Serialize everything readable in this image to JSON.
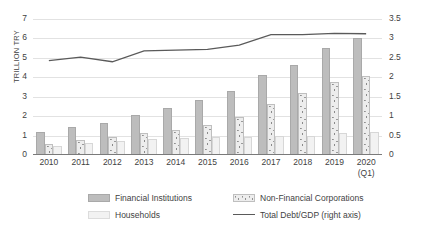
{
  "chart_data": {
    "type": "bar",
    "title": "",
    "subtitle": "",
    "xlabel": "",
    "ylabel": "TRILLION TRY",
    "ylabel_right": "",
    "categories": [
      "2010",
      "2011",
      "2012",
      "2013",
      "2014",
      "2015",
      "2016",
      "2017",
      "2018",
      "2019",
      "2020"
    ],
    "category_sublabels": [
      "",
      "",
      "",
      "",
      "",
      "",
      "",
      "",
      "",
      "",
      "(Q1)"
    ],
    "ylim": [
      0,
      7
    ],
    "yticks": [
      "0",
      "1",
      "2",
      "3",
      "4",
      "5",
      "6",
      "7"
    ],
    "ylim_right": [
      0,
      3.5
    ],
    "yticks_right": [
      "0",
      "0.5",
      "1",
      "1.5",
      "2",
      "2.5",
      "3",
      "3.5"
    ],
    "grid": true,
    "legend_position": "bottom",
    "series": [
      {
        "name": "Financial Institutions",
        "axis": "left",
        "type": "bar",
        "color": "#bdbdbd",
        "values": [
          1.2,
          1.45,
          1.65,
          2.05,
          2.4,
          2.85,
          3.3,
          4.1,
          4.65,
          5.5,
          6.0
        ]
      },
      {
        "name": "Non-Financial Corporations",
        "axis": "left",
        "type": "bar",
        "color": "#ededed",
        "values": [
          0.55,
          0.75,
          0.95,
          1.15,
          1.3,
          1.55,
          1.95,
          2.65,
          3.2,
          3.75,
          4.05
        ]
      },
      {
        "name": "Households",
        "axis": "left",
        "type": "bar",
        "color": "#f2f2f2",
        "values": [
          0.45,
          0.62,
          0.72,
          0.82,
          0.88,
          0.92,
          0.95,
          1.0,
          1.0,
          1.15,
          1.2
        ]
      },
      {
        "name": "Total Debt/GDP (right axis)",
        "axis": "right",
        "type": "line",
        "color": "#5a5a5a",
        "values": [
          2.43,
          2.52,
          2.4,
          2.68,
          2.7,
          2.72,
          2.83,
          3.1,
          3.1,
          3.13,
          3.12
        ]
      }
    ]
  },
  "legend": {
    "items": [
      {
        "label": "Financial Institutions",
        "swatch": "fi"
      },
      {
        "label": "Non-Financial Corporations",
        "swatch": "nfc"
      },
      {
        "label": "Households",
        "swatch": "hh"
      },
      {
        "label": "Total Debt/GDP (right axis)",
        "swatch": "line"
      }
    ]
  }
}
